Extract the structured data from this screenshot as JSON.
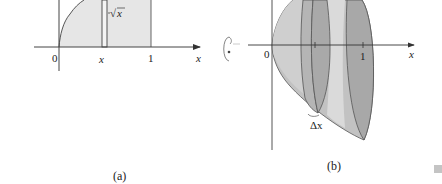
{
  "figure_a": {
    "caption": "(a)",
    "curve_label_radical": "√",
    "curve_label_var": "x",
    "origin_label": "0",
    "strip_label": "x",
    "right_bound_label": "1",
    "axis_label": "x"
  },
  "rotation_icon": "rotate-about-x-axis-icon",
  "figure_b": {
    "caption": "(b)",
    "origin_label": "0",
    "right_bound_label": "1",
    "axis_label": "x",
    "slab_label": "Δx"
  },
  "colors": {
    "light_fill": "#e4e4e4",
    "mid_fill": "#bdbdbd",
    "dark_fill": "#a6a6a6",
    "highlight_fill": "#d8d8d8",
    "stroke": "#555555"
  }
}
